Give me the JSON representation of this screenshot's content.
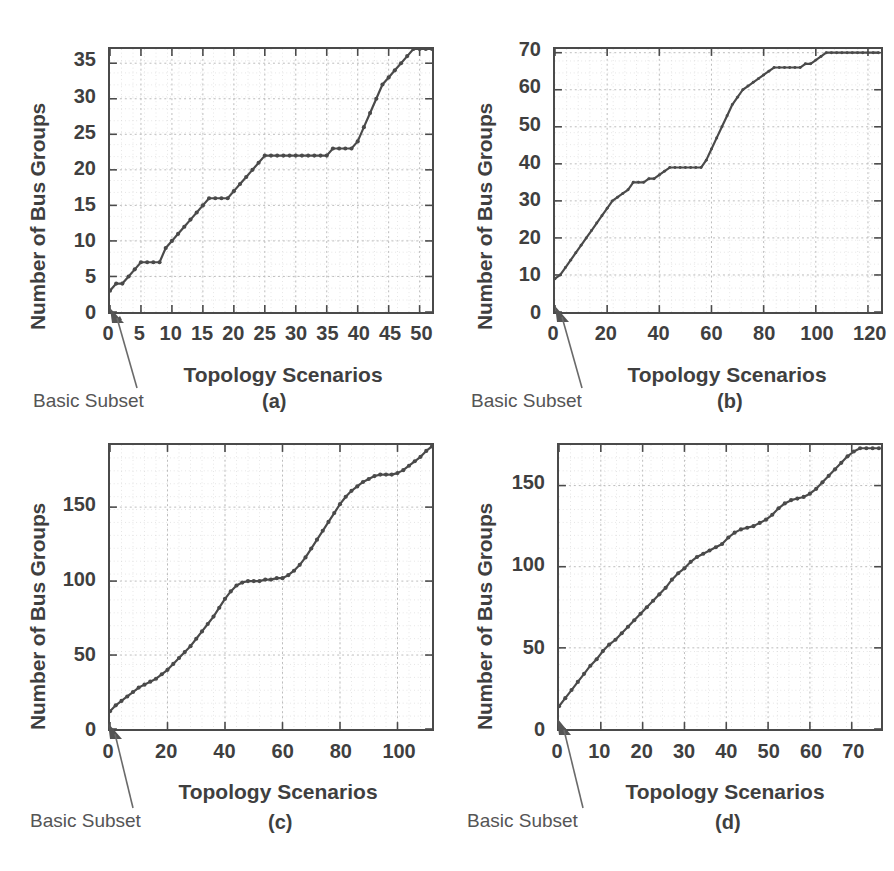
{
  "figure": {
    "background": "#ffffff",
    "curve_color": "#4a4a4a",
    "axis_color": "#4a4a4a",
    "grid_color": "#c8c8c8",
    "text_color": "#3f3f3f"
  },
  "common": {
    "ylabel": "Number of Bus Groups",
    "xlabel": "Topology Scenarios",
    "annotation": "Basic Subset"
  },
  "panels": [
    {
      "id": "a",
      "tag": "(a)"
    },
    {
      "id": "b",
      "tag": "(b)"
    },
    {
      "id": "c",
      "tag": "(c)"
    },
    {
      "id": "d",
      "tag": "(d)"
    }
  ],
  "chart_data": [
    {
      "panel": "a",
      "type": "line",
      "title": "(a)",
      "xlabel": "Topology Scenarios",
      "ylabel": "Number of Bus Groups",
      "xlim": [
        0,
        52
      ],
      "ylim": [
        0,
        37
      ],
      "xticks": [
        0,
        5,
        10,
        15,
        20,
        25,
        30,
        35,
        40,
        45,
        50
      ],
      "xticklabels": [
        "0",
        "5",
        "10",
        "15",
        "20",
        "25",
        "30",
        "35",
        "40",
        "45",
        "50"
      ],
      "yticks": [
        0,
        5,
        10,
        15,
        20,
        25,
        30,
        35
      ],
      "yticklabels": [
        "0",
        "5",
        "10",
        "15",
        "20",
        "25",
        "30",
        "35"
      ],
      "grid": true,
      "markers": true,
      "annotations": [
        {
          "text": "Basic Subset",
          "points_to_x": 0,
          "points_to_y": 3
        }
      ],
      "x": [
        0,
        1,
        2,
        3,
        4,
        5,
        6,
        7,
        8,
        9,
        10,
        11,
        12,
        13,
        14,
        15,
        16,
        17,
        18,
        19,
        20,
        21,
        22,
        23,
        24,
        25,
        26,
        27,
        28,
        29,
        30,
        31,
        32,
        33,
        34,
        35,
        36,
        37,
        38,
        39,
        40,
        41,
        42,
        43,
        44,
        45,
        46,
        47,
        48,
        49,
        50,
        51,
        52
      ],
      "y": [
        3,
        4,
        4,
        5,
        6,
        7,
        7,
        7,
        7,
        9,
        10,
        11,
        12,
        13,
        14,
        15,
        16,
        16,
        16,
        16,
        17,
        18,
        19,
        20,
        21,
        22,
        22,
        22,
        22,
        22,
        22,
        22,
        22,
        22,
        22,
        22,
        23,
        23,
        23,
        23,
        24,
        26,
        28,
        30,
        32,
        33,
        34,
        35,
        36,
        37,
        37,
        37,
        37
      ]
    },
    {
      "panel": "b",
      "type": "line",
      "title": "(b)",
      "xlabel": "Topology Scenarios",
      "ylabel": "Number of Bus Groups",
      "xlim": [
        0,
        125
      ],
      "ylim": [
        0,
        71
      ],
      "xticks": [
        0,
        20,
        40,
        60,
        80,
        100,
        120
      ],
      "xticklabels": [
        "0",
        "20",
        "40",
        "60",
        "80",
        "100",
        "120"
      ],
      "yticks": [
        0,
        10,
        20,
        30,
        40,
        50,
        60,
        70
      ],
      "yticklabels": [
        "0",
        "10",
        "20",
        "30",
        "40",
        "50",
        "60",
        "70"
      ],
      "grid": true,
      "markers": true,
      "annotations": [
        {
          "text": "Basic Subset",
          "points_to_x": 0,
          "points_to_y": 9
        }
      ],
      "x": [
        0,
        2,
        4,
        6,
        8,
        10,
        12,
        14,
        16,
        18,
        20,
        22,
        24,
        26,
        28,
        30,
        32,
        34,
        36,
        38,
        40,
        42,
        44,
        46,
        48,
        50,
        52,
        54,
        56,
        58,
        60,
        62,
        64,
        66,
        68,
        70,
        72,
        74,
        76,
        78,
        80,
        82,
        84,
        86,
        88,
        90,
        92,
        94,
        96,
        98,
        100,
        102,
        104,
        106,
        108,
        110,
        112,
        114,
        116,
        118,
        120,
        122,
        124
      ],
      "y": [
        9,
        10,
        12,
        14,
        16,
        18,
        20,
        22,
        24,
        26,
        28,
        30,
        31,
        32,
        33,
        35,
        35,
        35,
        36,
        36,
        37,
        38,
        39,
        39,
        39,
        39,
        39,
        39,
        39,
        41,
        44,
        47,
        50,
        53,
        56,
        58,
        60,
        61,
        62,
        63,
        64,
        65,
        66,
        66,
        66,
        66,
        66,
        66,
        67,
        67,
        68,
        69,
        70,
        70,
        70,
        70,
        70,
        70,
        70,
        70,
        70,
        70,
        70
      ]
    },
    {
      "panel": "c",
      "type": "line",
      "title": "(c)",
      "xlabel": "Topology Scenarios",
      "ylabel": "Number of Bus Groups",
      "xlim": [
        0,
        112
      ],
      "ylim": [
        0,
        192
      ],
      "xticks": [
        0,
        20,
        40,
        60,
        80,
        100
      ],
      "xticklabels": [
        "0",
        "20",
        "40",
        "60",
        "80",
        "100"
      ],
      "yticks": [
        0,
        50,
        100,
        150
      ],
      "yticklabels": [
        "0",
        "50",
        "100",
        "150"
      ],
      "grid": true,
      "markers": true,
      "annotations": [
        {
          "text": "Basic Subset",
          "points_to_x": 0,
          "points_to_y": 12
        }
      ],
      "x": [
        0,
        2,
        4,
        6,
        8,
        10,
        12,
        14,
        16,
        18,
        20,
        22,
        24,
        26,
        28,
        30,
        32,
        34,
        36,
        38,
        40,
        42,
        44,
        46,
        48,
        50,
        52,
        54,
        56,
        58,
        60,
        62,
        64,
        66,
        68,
        70,
        72,
        74,
        76,
        78,
        80,
        82,
        84,
        86,
        88,
        90,
        92,
        94,
        96,
        98,
        100,
        102,
        104,
        106,
        108,
        110,
        112
      ],
      "y": [
        12,
        16,
        19,
        22,
        25,
        28,
        30,
        32,
        34,
        37,
        40,
        44,
        48,
        52,
        56,
        61,
        66,
        71,
        76,
        82,
        88,
        93,
        97,
        99,
        100,
        100,
        100,
        101,
        101,
        102,
        102,
        104,
        107,
        111,
        116,
        122,
        128,
        134,
        140,
        146,
        152,
        157,
        161,
        164,
        167,
        169,
        171,
        172,
        172,
        172,
        173,
        175,
        178,
        181,
        184,
        188,
        191
      ]
    },
    {
      "panel": "d",
      "type": "line",
      "title": "(d)",
      "xlabel": "Topology Scenarios",
      "ylabel": "Number of Bus Groups",
      "xlim": [
        0,
        77
      ],
      "ylim": [
        0,
        175
      ],
      "xticks": [
        0,
        10,
        20,
        30,
        40,
        50,
        60,
        70
      ],
      "xticklabels": [
        "0",
        "10",
        "20",
        "30",
        "40",
        "50",
        "60",
        "70"
      ],
      "yticks": [
        0,
        50,
        100,
        150
      ],
      "yticklabels": [
        "0",
        "50",
        "100",
        "150"
      ],
      "grid": true,
      "markers": true,
      "annotations": [
        {
          "text": "Basic Subset",
          "points_to_x": 0,
          "points_to_y": 14
        }
      ],
      "x": [
        0,
        1.5,
        3,
        4.5,
        6,
        7.5,
        9,
        10.5,
        12,
        13.5,
        15,
        16.5,
        18,
        19.5,
        21,
        22.5,
        24,
        25.5,
        27,
        28.5,
        30,
        31.5,
        33,
        34.5,
        36,
        37.5,
        39,
        40.5,
        42,
        43.5,
        45,
        46.5,
        48,
        49.5,
        51,
        52.5,
        54,
        55.5,
        57,
        58.5,
        60,
        61.5,
        63,
        64.5,
        66,
        67.5,
        69,
        70.5,
        72,
        73.5,
        75,
        76.5
      ],
      "y": [
        14,
        19,
        24,
        29,
        34,
        39,
        43,
        48,
        52,
        55,
        59,
        63,
        67,
        71,
        75,
        79,
        83,
        87,
        92,
        96,
        99,
        103,
        106,
        108,
        110,
        112,
        114,
        118,
        121,
        123,
        124,
        125,
        127,
        129,
        132,
        136,
        139,
        141,
        142,
        143,
        145,
        148,
        152,
        156,
        160,
        164,
        168,
        171,
        173,
        173,
        173,
        173
      ]
    }
  ]
}
